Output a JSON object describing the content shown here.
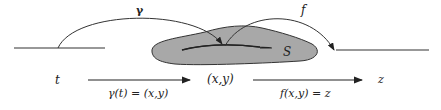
{
  "diagram": {
    "labels": {
      "gamma_arc": "γ",
      "f_arc": "f",
      "region": "S",
      "t": "t",
      "xy": "(x,y)",
      "z": "z",
      "gamma_eq": "γ(t) = (x,y)",
      "f_eq": "f(x,y) = z"
    },
    "colors": {
      "region_fill": "#a8a8a8",
      "stroke": "#333333"
    }
  }
}
